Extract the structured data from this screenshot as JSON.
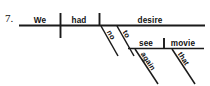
{
  "exercise": {
    "number": "7."
  },
  "diagram": {
    "type": "reed-kellogg-sentence-diagram",
    "sentence": "We had no desire to see that movie again",
    "ink_color": "#1a1a1a",
    "background_color": "#ffffff",
    "main_clause": {
      "subject": "We",
      "verb": "had",
      "direct_object": "desire"
    },
    "modifiers": [
      {
        "word": "no",
        "attaches_to": "desire",
        "kind": "adjective"
      },
      {
        "word": "to",
        "attaches_to": "desire",
        "kind": "infinitive-marker"
      },
      {
        "word": "again",
        "attaches_to": "see",
        "kind": "adverb"
      },
      {
        "word": "that",
        "attaches_to": "movie",
        "kind": "adjective"
      }
    ],
    "infinitive_phrase": {
      "verb": "see",
      "direct_object": "movie"
    },
    "words": {
      "we": "We",
      "had": "had",
      "desire": "desire",
      "no": "no",
      "to": "to",
      "see": "see",
      "movie": "movie",
      "again": "again",
      "that": "that"
    }
  }
}
